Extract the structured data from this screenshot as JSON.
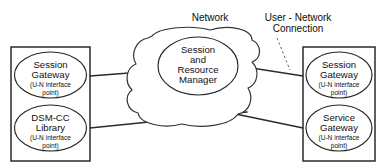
{
  "diagram": {
    "annotations": [
      {
        "id": "network",
        "text": "Network"
      },
      {
        "id": "user-network-connection-line1",
        "text": "User - Network"
      },
      {
        "id": "user-network-connection-line2",
        "text": "Connection"
      }
    ],
    "hub": {
      "label": "Network",
      "node": {
        "name": "session-and-resource-manager",
        "line1": "Session",
        "line2": "and",
        "line3": "Resource",
        "line4": "Manager"
      }
    },
    "left_group": {
      "name": "client-side-group",
      "nodes": [
        {
          "name": "session-gateway",
          "line1": "Session",
          "line2": "Gateway",
          "sub1": "(U-N interface",
          "sub2": "point)"
        },
        {
          "name": "dsm-cc-library",
          "line1": "DSM-CC",
          "line2": "Library",
          "sub1": "(U-N interface",
          "sub2": "point)"
        }
      ]
    },
    "right_group": {
      "name": "server-side-group",
      "nodes": [
        {
          "name": "session-gateway",
          "line1": "Session",
          "line2": "Gateway",
          "sub1": "(U-N interface",
          "sub2": "point)"
        },
        {
          "name": "service-gateway",
          "line1": "Service",
          "line2": "Gateway",
          "sub1": "(U-N interface",
          "sub2": "point)"
        }
      ]
    },
    "colors": {
      "background": "#ffffff",
      "stroke": "#262626",
      "text": "#111111",
      "leader": "#666666"
    }
  }
}
